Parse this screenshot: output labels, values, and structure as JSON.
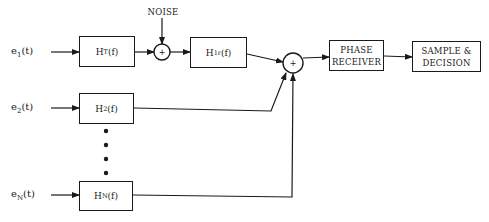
{
  "diagram": {
    "type": "block-diagram",
    "colors": {
      "line": "#1a1a1a",
      "text": "#222222",
      "background": "#ffffff"
    },
    "inputs": [
      {
        "id": "e1",
        "base": "e",
        "sub": "1",
        "suffix": "(t)"
      },
      {
        "id": "e2",
        "base": "e",
        "sub": "2",
        "suffix": "(t)"
      },
      {
        "id": "eN",
        "base": "e",
        "sub": "N",
        "suffix": "(t)"
      }
    ],
    "blocks": {
      "ht": {
        "base": "H",
        "sub": "T",
        "suffix": "(f)"
      },
      "h1r": {
        "base": "H",
        "sub": "1r",
        "suffix": "(f)"
      },
      "h2": {
        "base": "H",
        "sub": "2",
        "suffix": "(f)"
      },
      "hn": {
        "base": "H",
        "sub": "N",
        "suffix": "(f)"
      },
      "phase_receiver": {
        "line1": "PHASE",
        "line2": "RECEIVER"
      },
      "sample_decision": {
        "line1": "SAMPLE &",
        "line2": "DECISION"
      }
    },
    "noise_label": "NOISE",
    "summers": [
      {
        "id": "sum1",
        "symbol": "+"
      },
      {
        "id": "sum2",
        "symbol": "+"
      }
    ],
    "ellipsis_dots": 4
  }
}
